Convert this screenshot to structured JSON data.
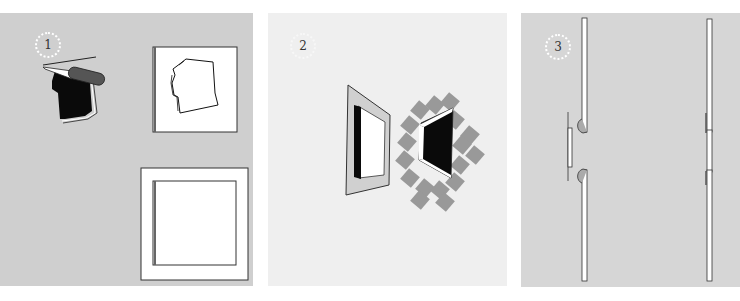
{
  "figure": {
    "steps": [
      {
        "number": "1",
        "description": "Cut shape with knife; shape on board; square board with border"
      },
      {
        "number": "2",
        "description": "Perspective frames: framed panel and tiled window opening"
      },
      {
        "number": "3",
        "description": "Side section of panels joining"
      }
    ]
  },
  "colors": {
    "panel1_bg": "#cfcfcf",
    "panel2_bg": "#efefef",
    "panel3_bg": "#d6d6d6",
    "tile_gray": "#999999",
    "ink": "#111111"
  }
}
